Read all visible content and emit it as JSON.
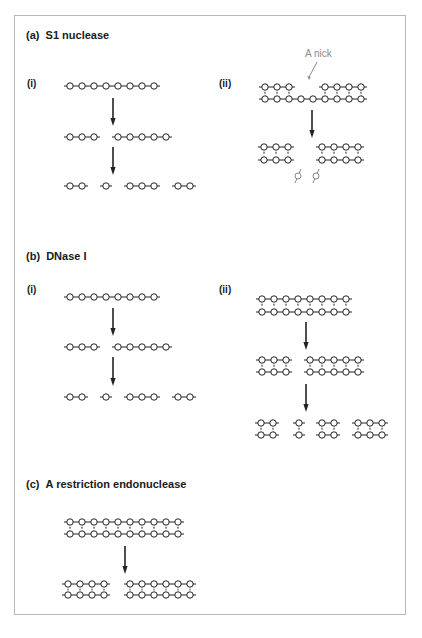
{
  "sections": [
    {
      "id": "a",
      "label": "(a)",
      "title": "S1 nuclease",
      "x": 26,
      "y": 29
    },
    {
      "id": "b",
      "label": "(b)",
      "title": "DNase I",
      "x": 26,
      "y": 250
    },
    {
      "id": "c",
      "label": "(c)",
      "title": "A restriction endonuclease",
      "x": 26,
      "y": 478
    }
  ],
  "sublabels": [
    {
      "text": "(i)",
      "x": 27,
      "y": 78
    },
    {
      "text": "(ii)",
      "x": 219,
      "y": 78
    },
    {
      "text": "(i)",
      "x": 27,
      "y": 284
    },
    {
      "text": "(ii)",
      "x": 219,
      "y": 284
    }
  ],
  "annotation": {
    "text": "A nick",
    "x": 305,
    "y": 48,
    "color": "#8a8a8a"
  },
  "colors": {
    "line": "#222222",
    "circle_fill": "#ffffff",
    "grey": "#8a8a8a",
    "frame": "#b8b8b8"
  },
  "spacing": 12,
  "single_strands": [
    {
      "y": 86,
      "groups": [
        [
          70,
          8
        ]
      ]
    },
    {
      "y": 137,
      "groups": [
        [
          70,
          3
        ],
        [
          118,
          5
        ]
      ]
    },
    {
      "y": 186,
      "groups": [
        [
          70,
          2
        ],
        [
          106,
          1
        ],
        [
          130,
          3
        ],
        [
          178,
          2
        ]
      ]
    },
    {
      "y": 297,
      "groups": [
        [
          70,
          8
        ]
      ]
    },
    {
      "y": 347,
      "groups": [
        [
          70,
          3
        ],
        [
          118,
          5
        ]
      ]
    },
    {
      "y": 397,
      "groups": [
        [
          70,
          2
        ],
        [
          106,
          1
        ],
        [
          130,
          3
        ],
        [
          178,
          2
        ]
      ]
    }
  ],
  "double_strands": [
    {
      "top": 87,
      "bottom": 99,
      "topGroups": [
        [
          265,
          3
        ],
        [
          325,
          4
        ]
      ],
      "bottomGroups": [
        [
          265,
          9
        ]
      ],
      "pairs": [
        265,
        277,
        289,
        325,
        337,
        349,
        361
      ]
    },
    {
      "top": 147,
      "bottom": 160,
      "topGroups": [
        [
          264,
          3
        ],
        [
          322,
          4
        ]
      ],
      "bottomGroups": [
        [
          264,
          3
        ],
        [
          322,
          4
        ]
      ],
      "pairs": [
        264,
        276,
        288,
        322,
        334,
        346,
        358
      ]
    },
    {
      "top": 299,
      "bottom": 312,
      "topGroups": [
        [
          262,
          8
        ]
      ],
      "bottomGroups": [
        [
          262,
          8
        ]
      ],
      "pairs": [
        262,
        274,
        286,
        298,
        310,
        322,
        334,
        346
      ]
    },
    {
      "top": 360,
      "bottom": 372,
      "topGroups": [
        [
          262,
          3
        ],
        [
          310,
          5
        ]
      ],
      "bottomGroups": [
        [
          262,
          3
        ],
        [
          310,
          5
        ]
      ],
      "pairs": [
        262,
        274,
        286,
        310,
        322,
        334,
        346,
        358
      ]
    },
    {
      "top": 423,
      "bottom": 435,
      "topGroups": [
        [
          261,
          2
        ],
        [
          299,
          1
        ],
        [
          322,
          2
        ],
        [
          358,
          3
        ]
      ],
      "bottomGroups": [
        [
          261,
          2
        ],
        [
          299,
          1
        ],
        [
          322,
          2
        ],
        [
          358,
          3
        ]
      ],
      "pairs": [
        261,
        273,
        299,
        322,
        334,
        358,
        370,
        382
      ]
    },
    {
      "top": 522,
      "bottom": 534,
      "topGroups": [
        [
          70,
          10
        ]
      ],
      "bottomGroups": [
        [
          70,
          10
        ]
      ],
      "pairs": [
        70,
        82,
        94,
        106,
        118,
        130,
        142,
        154,
        166,
        178
      ]
    },
    {
      "top": 584,
      "bottom": 595,
      "topGroups": [
        [
          68,
          4
        ],
        [
          130,
          6
        ]
      ],
      "bottomGroups": [
        [
          68,
          4
        ],
        [
          130,
          6
        ]
      ],
      "pairs": [
        68,
        80,
        92,
        104,
        130,
        142,
        154,
        166,
        178,
        190
      ]
    }
  ],
  "arrows": [
    {
      "x": 113,
      "y1": 98,
      "y2": 126
    },
    {
      "x": 113,
      "y1": 147,
      "y2": 175
    },
    {
      "x": 312,
      "y1": 110,
      "y2": 138
    },
    {
      "x": 113,
      "y1": 308,
      "y2": 336
    },
    {
      "x": 113,
      "y1": 357,
      "y2": 386
    },
    {
      "x": 306,
      "y1": 322,
      "y2": 350
    },
    {
      "x": 306,
      "y1": 384,
      "y2": 412
    },
    {
      "x": 125,
      "y1": 546,
      "y2": 574
    }
  ],
  "nick_pointer": {
    "x1": 317,
    "y1": 62,
    "x2": 309,
    "y2": 80
  },
  "free_nucleotides": [
    {
      "x": 298,
      "y": 176
    },
    {
      "x": 316,
      "y": 176
    }
  ]
}
